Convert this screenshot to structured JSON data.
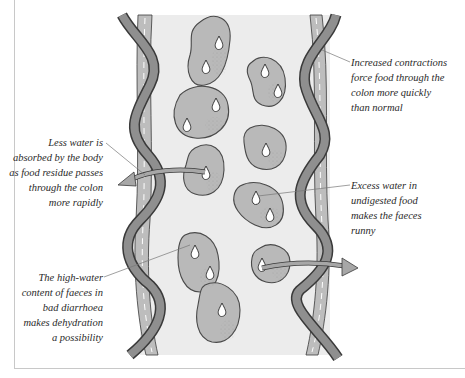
{
  "diagram": {
    "colors": {
      "lumen": "#ececec",
      "wall_band": "#8f8f8f",
      "wall_band_outline": "#3a3a3a",
      "inner_lining": "#bdbdbd",
      "food_blob": "#b9b9b9",
      "food_outline": "#4a4a4a",
      "arrow": "#a7a7a7",
      "leader_line": "#777777",
      "frame_border": "#c8c8c8"
    },
    "icons": {
      "water-drop": "teardrop outline inside each food lump",
      "water-arrow": "curved arrow leaving the colon"
    },
    "labels": {
      "top_right": {
        "lines": [
          "Increased contractions",
          "force food through the",
          "colon more quickly",
          "than normal"
        ]
      },
      "left_middle": {
        "lines": [
          "Less water is",
          "absorbed by the body",
          "as food residue passes",
          "through the colon",
          "more rapidly"
        ]
      },
      "right_middle": {
        "lines": [
          "Excess water in",
          "undigested food",
          "makes the faeces",
          "runny"
        ]
      },
      "left_bottom": {
        "lines": [
          "The high-water",
          "content of faeces in",
          "bad diarrhoea",
          "makes dehydration",
          "a possibility"
        ]
      }
    }
  }
}
